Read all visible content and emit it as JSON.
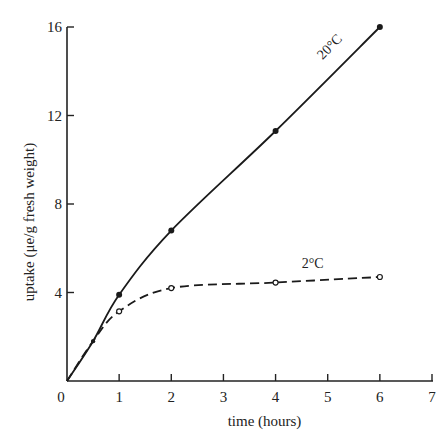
{
  "chart_data": {
    "type": "line",
    "title": "",
    "xlabel": "time (hours)",
    "ylabel": "uptake (μe/g fresh weight)",
    "xlim": [
      0,
      7
    ],
    "ylim": [
      0,
      16
    ],
    "xticks": [
      0,
      1,
      2,
      3,
      4,
      5,
      6,
      7
    ],
    "yticks": [
      0,
      4,
      8,
      12,
      16
    ],
    "grid": false,
    "legend": "inline labels",
    "series": [
      {
        "name": "20°C",
        "style": "solid",
        "marker": "filled-circle",
        "x": [
          0,
          0.5,
          1,
          2,
          4,
          6
        ],
        "y": [
          0,
          1.8,
          3.9,
          6.8,
          11.3,
          16.0
        ],
        "label_pos": [
          4.9,
          14.5
        ],
        "label_rotation": -45
      },
      {
        "name": "2°C",
        "style": "dashed",
        "marker": "open-circle",
        "x": [
          0,
          0.5,
          1,
          2,
          4,
          6
        ],
        "y": [
          0,
          1.8,
          3.15,
          4.2,
          4.45,
          4.7
        ],
        "label_pos": [
          4.5,
          5.1
        ],
        "label_rotation": 0
      }
    ]
  },
  "labels": {
    "series_20": "20°C",
    "series_2": "2°C",
    "xlabel": "time (hours)",
    "ylabel": "uptake (μe/g fresh weight)"
  }
}
